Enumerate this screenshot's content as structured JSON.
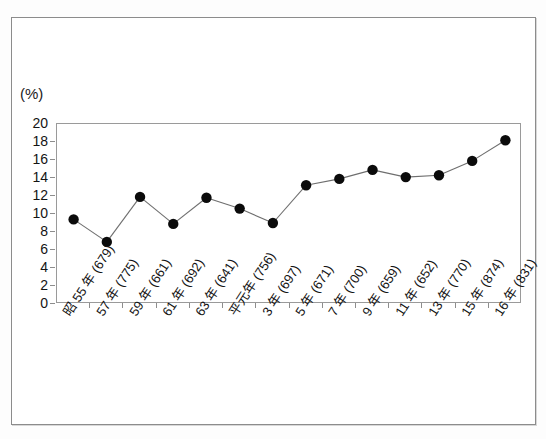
{
  "figure": {
    "unit_label": "(%)"
  },
  "chart_data": {
    "type": "line",
    "title": "",
    "xlabel": "",
    "ylabel": "(%)",
    "ylim": [
      0,
      20
    ],
    "ytick_step": 2,
    "grid": false,
    "legend": "none",
    "marker": "filled-circle",
    "categories": [
      "昭 55 年 (679)",
      "57 年 (775)",
      "59 年 (661)",
      "61 年 (692)",
      "63 年 (641)",
      "平元年 (756)",
      "3 年 (697)",
      "5 年 (671)",
      "7 年 (700)",
      "9 年 (659)",
      "11 年 (652)",
      "13 年 (770)",
      "15 年 (874)",
      "16 年 (831)"
    ],
    "values": [
      9.4,
      6.9,
      11.9,
      8.9,
      11.8,
      10.6,
      9.0,
      13.2,
      13.9,
      14.9,
      14.1,
      14.3,
      15.9,
      18.2
    ],
    "yticks": [
      0,
      2,
      4,
      6,
      8,
      10,
      12,
      14,
      16,
      18,
      20
    ],
    "colors": {
      "marker": "#0b0b0b",
      "line": "#6e6e6e",
      "axis": "#9a9a9a",
      "text": "#131313",
      "frame": "#8c8c8c",
      "background": "#ffffff"
    }
  }
}
